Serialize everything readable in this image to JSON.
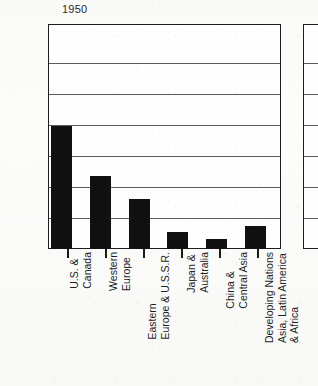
{
  "chart_data": {
    "type": "bar",
    "title": "1950",
    "xlabel": "",
    "ylabel": "",
    "ylim": [
      0,
      1300
    ],
    "grid": true,
    "legend": false,
    "yticks": [
      200,
      400,
      600,
      800,
      1000,
      1200
    ],
    "categories": [
      "U.S. & Canada",
      "Western Europe",
      "Eastern Europe & U.S.S.R.",
      "Japan & Australia",
      "China & Central Asia",
      "Developing Nations Asia, Latin America & Africa"
    ],
    "values": [
      710,
      420,
      290,
      100,
      60,
      135
    ],
    "bar_color": "#111111"
  },
  "panel_main": {
    "title": "1950",
    "axis": {
      "ytick_labels": [
        "1200",
        "1000",
        "800",
        "600",
        "400",
        "200"
      ]
    },
    "categories": [
      {
        "lines": [
          "U.S. &",
          "Canada"
        ],
        "value": 710
      },
      {
        "lines": [
          "Western",
          "Europe"
        ],
        "value": 420
      },
      {
        "lines": [
          "Eastern",
          "Europe & U.S.S.R."
        ],
        "value": 290
      },
      {
        "lines": [
          "Japan &",
          "Australia"
        ],
        "value": 100
      },
      {
        "lines": [
          "China &",
          "Central Asia"
        ],
        "value": 60
      },
      {
        "lines": [
          "Developing Nations",
          "Asia, Latin America",
          "& Africa"
        ],
        "value": 135
      }
    ]
  },
  "panel_next": {
    "note": ""
  }
}
